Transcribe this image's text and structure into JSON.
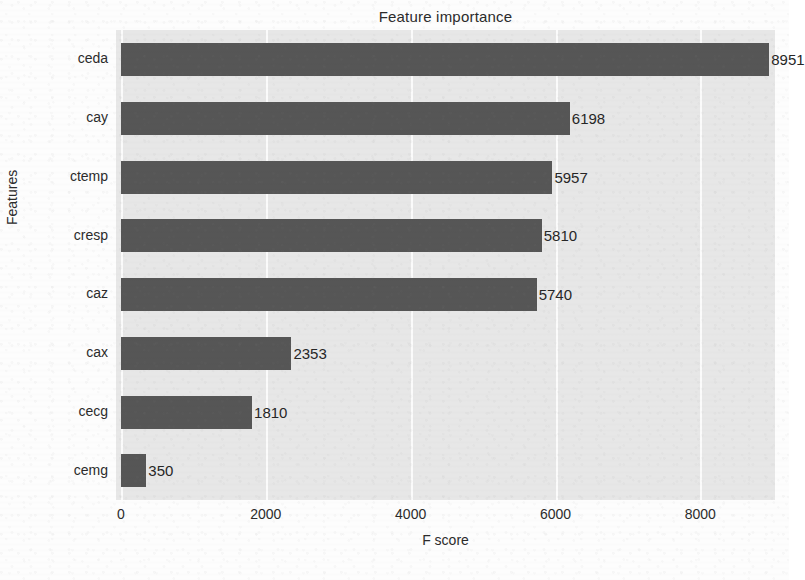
{
  "chart_data": {
    "type": "bar",
    "orientation": "horizontal",
    "title": "Feature importance",
    "xlabel": "F score",
    "ylabel": "Features",
    "categories": [
      "ceda",
      "cay",
      "ctemp",
      "cresp",
      "caz",
      "cax",
      "cecg",
      "cemg"
    ],
    "values": [
      8951,
      6198,
      5957,
      5810,
      5740,
      2353,
      1810,
      350
    ],
    "value_labels": [
      "8951",
      "6198",
      "5957",
      "5810",
      "5740",
      "2353",
      "1810",
      "350"
    ],
    "xticks": [
      0,
      2000,
      4000,
      6000,
      8000
    ],
    "xtick_labels": [
      "0",
      "2000",
      "4000",
      "6000",
      "8000"
    ],
    "xlim": [
      0,
      9100
    ],
    "ylim_categories": 8,
    "grid": "vertical-white",
    "legend": null,
    "bar_color": "#565656",
    "plot_background": "#e7e7e7",
    "grid_color": "#fbfbfb",
    "text_color": "#2b2b2b"
  }
}
